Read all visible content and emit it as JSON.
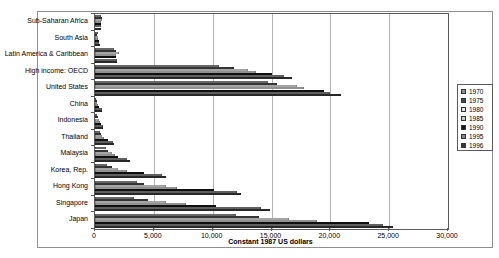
{
  "chart_data": {
    "type": "bar",
    "orientation": "horizontal",
    "title": "",
    "xlabel": "Constant 1987 US dollars",
    "xlim": [
      0,
      30000
    ],
    "xticks": [
      0,
      5000,
      10000,
      15000,
      20000,
      25000,
      30000
    ],
    "xtick_labels": [
      "0",
      "5,000",
      "10,000",
      "15,000",
      "20,000",
      "25,000",
      "30,000"
    ],
    "grid": "vertical",
    "legend_position": "right",
    "categories": [
      "Sub-Saharan Africa",
      "South Asia",
      "Latin America & Caribbean",
      "High income: OECD",
      "United States",
      "China",
      "Indonesia",
      "Thailand",
      "Malaysia",
      "Korea, Rep.",
      "Hong Kong",
      "Singapore",
      "Japan"
    ],
    "series": [
      {
        "name": "1970",
        "color": "#909090",
        "values": [
          540,
          220,
          1620,
          10500,
          14700,
          110,
          210,
          390,
          900,
          1040,
          3600,
          3300,
          12000
        ]
      },
      {
        "name": "1975",
        "color": "#4a4a4a",
        "values": [
          570,
          210,
          1810,
          11800,
          15500,
          130,
          260,
          480,
          1130,
          1450,
          4200,
          4500,
          13900
        ]
      },
      {
        "name": "1980",
        "color": "#e2e2e2",
        "values": [
          590,
          230,
          2030,
          13000,
          17200,
          170,
          340,
          620,
          1440,
          1950,
          6000,
          6000,
          16500
        ]
      },
      {
        "name": "1985",
        "color": "#c8c8c8",
        "values": [
          540,
          270,
          1790,
          13700,
          17800,
          250,
          410,
          730,
          1670,
          2690,
          7000,
          7700,
          18900
        ]
      },
      {
        "name": "1990",
        "color": "#161616",
        "values": [
          520,
          320,
          1770,
          15000,
          19500,
          340,
          510,
          1090,
          1980,
          4130,
          10100,
          10300,
          23300
        ]
      },
      {
        "name": "1995",
        "color": "#858585",
        "values": [
          480,
          370,
          1870,
          16100,
          20000,
          580,
          680,
          1560,
          2740,
          5710,
          12100,
          14100,
          24500
        ]
      },
      {
        "name": "1996",
        "color": "#383838",
        "values": [
          490,
          390,
          1900,
          16700,
          20900,
          630,
          720,
          1630,
          2960,
          6040,
          12400,
          14900,
          25300
        ]
      }
    ]
  }
}
